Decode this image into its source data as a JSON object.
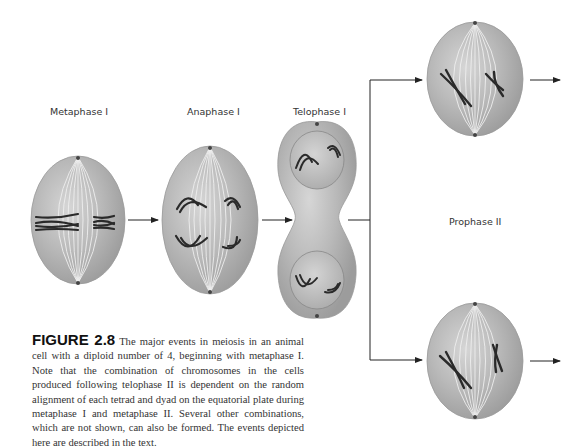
{
  "figure": {
    "stages": [
      {
        "id": "metaphase-1",
        "label": "Metaphase I"
      },
      {
        "id": "anaphase-1",
        "label": "Anaphase I"
      },
      {
        "id": "telophase-1",
        "label": "Telophase I"
      },
      {
        "id": "prophase-2",
        "label": "Prophase II"
      }
    ],
    "caption": {
      "label": "FIGURE 2.8",
      "text": "The major events in meiosis in an animal cell with a diploid number of 4, beginning with metaphase I. Note that the combination of chromosomes in the cells produced following telophase II is dependent on the random alignment of each tetrad and dyad on the equatorial plate during metaphase I and metaphase II. Several other combinations, which are not shown, can also be formed. The events depicted here are described in the text."
    },
    "colors": {
      "cell_fill": "#b8b8b8",
      "cell_edge": "#9a9a9a",
      "spindle": "#e8e8e8",
      "chromosome": "#2a2a2a",
      "arrow": "#222222"
    }
  }
}
